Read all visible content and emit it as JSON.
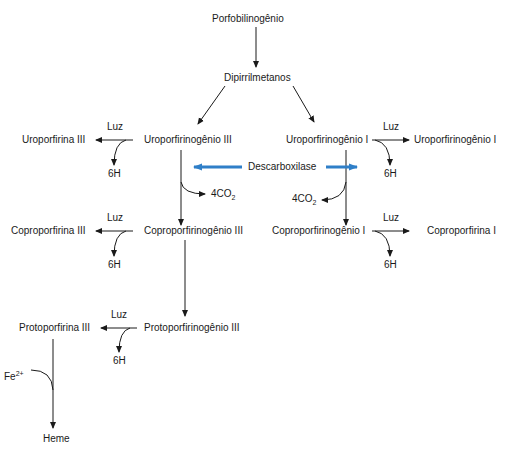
{
  "diagram": {
    "nodes": {
      "porfobilinogenio": "Porfobilinogênio",
      "dipirrilmetanos": "Dipirrilmetanos",
      "uroporfirinogenio_iii": "Uroporfirinogênio III",
      "uroporfirinogenio_i": "Uroporfirinogênio I",
      "uroporfirina_iii": "Uroporfirina III",
      "uroporfirinogenio_i_right": "Uroporfirinogênio I",
      "descarboxilase": "Descarboxilase",
      "coproporfirinogenio_iii": "Coproporfirinogênio III",
      "coproporfirinogenio_i": "Coproporfirinogênio I",
      "coproporfirina_iii": "Coproporfirina III",
      "coproporfirina_i": "Coproporfirina I",
      "protoporfirinogenio_iii": "Protoporfirinogênio III",
      "protoporfirina_iii": "Protoporfirina III",
      "heme": "Heme"
    },
    "side_labels": {
      "luz": "Luz",
      "six_h": "6H",
      "co2_prefix": "4CO",
      "co2_sub": "2",
      "fe_prefix": "Fe",
      "fe_sup": "2+"
    },
    "colors": {
      "line": "#1a1a1a",
      "enzyme_arrow": "#2f7fc8"
    }
  }
}
